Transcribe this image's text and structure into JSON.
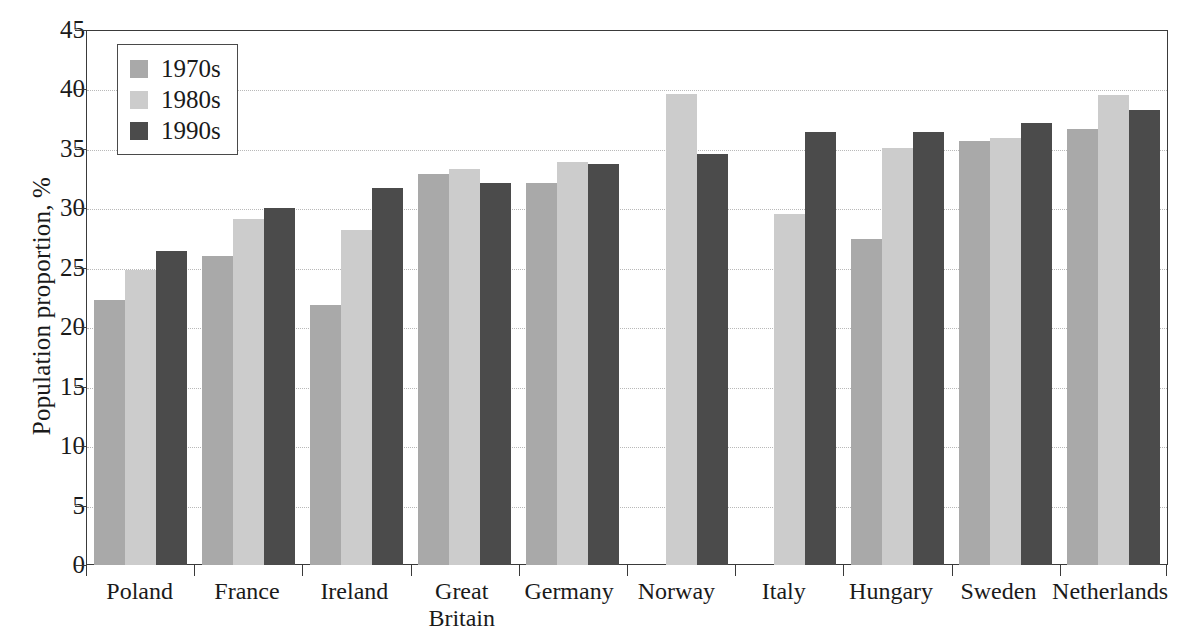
{
  "chart_data": {
    "type": "bar",
    "title": "",
    "xlabel": "",
    "ylabel": "Population proportion, %",
    "ylim": [
      0,
      45
    ],
    "ytick_step": 5,
    "yticks": [
      45,
      40,
      35,
      30,
      25,
      20,
      15,
      10,
      5,
      0
    ],
    "grid": true,
    "legend_position": "top-left",
    "categories": [
      "Poland",
      "France",
      "Ireland",
      "Great Britain",
      "Germany",
      "Norway",
      "Italy",
      "Hungary",
      "Sweden",
      "Netherlands"
    ],
    "category_lines": [
      [
        "Poland"
      ],
      [
        "France"
      ],
      [
        "Ireland"
      ],
      [
        "Great",
        "Britain"
      ],
      [
        "Germany"
      ],
      [
        "Norway"
      ],
      [
        "Italy"
      ],
      [
        "Hungary"
      ],
      [
        "Sweden"
      ],
      [
        "Netherlands"
      ]
    ],
    "series": [
      {
        "name": "1970s",
        "color": "#a9a9a9",
        "values": [
          22.3,
          26.0,
          21.9,
          32.9,
          32.1,
          null,
          null,
          27.4,
          35.7,
          36.7
        ]
      },
      {
        "name": "1980s",
        "color": "#cccccc",
        "values": [
          24.8,
          29.1,
          28.2,
          33.3,
          33.9,
          39.6,
          29.5,
          35.1,
          35.9,
          39.5
        ]
      },
      {
        "name": "1990s",
        "color": "#4b4b4b",
        "values": [
          26.4,
          30.0,
          31.7,
          32.1,
          33.7,
          34.6,
          36.4,
          36.4,
          37.2,
          38.3
        ]
      }
    ]
  },
  "legend": {
    "items": [
      {
        "label": "1970s",
        "color": "#a9a9a9"
      },
      {
        "label": "1980s",
        "color": "#cccccc"
      },
      {
        "label": "1990s",
        "color": "#4b4b4b"
      }
    ]
  },
  "axes": {
    "y_title": "Population proportion, %"
  }
}
